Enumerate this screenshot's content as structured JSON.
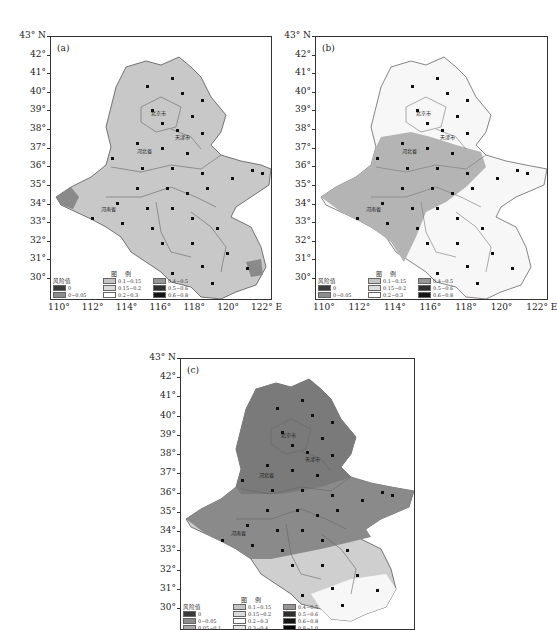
{
  "figure": {
    "panels": [
      {
        "id": "a",
        "label": "(a)",
        "scheme": "uniform-light"
      },
      {
        "id": "b",
        "label": "(b)",
        "scheme": "west-medium-east-light"
      },
      {
        "id": "c",
        "label": "(c)",
        "scheme": "north-dark-south-light"
      }
    ],
    "y_axis": {
      "top_label": "43° N",
      "labels": [
        "42°",
        "41°",
        "40°",
        "39°",
        "38°",
        "37°",
        "36°",
        "35°",
        "34°",
        "33°",
        "32°",
        "31°",
        "30°"
      ]
    },
    "x_axis": {
      "labels": [
        "110°",
        "112°",
        "114°",
        "116°",
        "118°",
        "120°",
        "122° E"
      ]
    },
    "map_labels": {
      "beijing": "北京市",
      "tianjin": "天津市",
      "hebei": "河北省",
      "shandong": "山东省",
      "henan": "河南省",
      "anhui": "安徽省",
      "jiangsu": "江苏省"
    },
    "legend": {
      "title": "图 例",
      "heading": "风险值",
      "items": [
        {
          "label": "0",
          "color": "#3a3a3a"
        },
        {
          "label": "0~0.05",
          "color": "#8c8c8c"
        },
        {
          "label": "0.05~0.1",
          "color": "#a8a8a8"
        },
        {
          "label": "0.1~0.15",
          "color": "#c4c4c4"
        },
        {
          "label": "0.15~0.2",
          "color": "#dcdcdc"
        },
        {
          "label": "0.2~0.3",
          "color": "#ffffff"
        },
        {
          "label": "0.3~0.4",
          "color": "#e6e6e6"
        },
        {
          "label": "0.4~0.5",
          "color": "#969696"
        },
        {
          "label": "0.5~0.6",
          "color": "#2e2e2e"
        },
        {
          "label": "0.6~0.8",
          "color": "#141414"
        },
        {
          "label": "0.8~1.0",
          "color": "#000000"
        }
      ]
    },
    "colors": {
      "region_light": "#c8c8c8",
      "region_medium": "#b0b0b0",
      "region_dark": "#8a8a8a",
      "region_white": "#f7f7f7",
      "boundary": "#555555"
    }
  }
}
